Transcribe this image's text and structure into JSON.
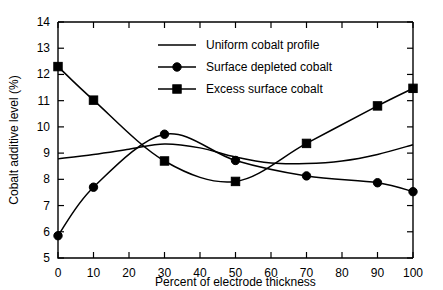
{
  "chart_data": {
    "type": "line",
    "title": "",
    "xlabel": "Percent of electrode thickness",
    "ylabel": "Cobalt additive level (%)",
    "x": [
      0,
      10,
      20,
      30,
      40,
      50,
      60,
      70,
      80,
      90,
      100
    ],
    "xlim": [
      0,
      100
    ],
    "ylim": [
      5,
      14
    ],
    "xticks": [
      "0",
      "10",
      "20",
      "30",
      "40",
      "50",
      "60",
      "70",
      "80",
      "90",
      "100"
    ],
    "yticks": [
      "5",
      "6",
      "7",
      "8",
      "9",
      "10",
      "11",
      "12",
      "13",
      "14"
    ],
    "grid": false,
    "legend_position": "top-center",
    "series": [
      {
        "name": "Uniform cobalt profile",
        "marker": "none",
        "x": [
          0,
          10,
          20,
          30,
          40,
          50,
          60,
          70,
          80,
          90,
          100
        ],
        "values": [
          8.78,
          8.95,
          9.15,
          9.35,
          9.2,
          8.85,
          8.62,
          8.6,
          8.7,
          8.95,
          9.32
        ]
      },
      {
        "name": "Surface depleted cobalt",
        "marker": "circle",
        "x": [
          0,
          10,
          30,
          50,
          70,
          90,
          100
        ],
        "values": [
          5.85,
          7.7,
          9.72,
          8.72,
          8.13,
          7.87,
          7.53
        ]
      },
      {
        "name": "Excess surface cobalt",
        "marker": "square",
        "x": [
          0,
          10,
          30,
          50,
          70,
          90,
          100
        ],
        "values": [
          12.3,
          11.02,
          8.7,
          7.92,
          9.37,
          10.8,
          11.47
        ]
      }
    ]
  },
  "legend": {
    "items": [
      {
        "label": "Uniform cobalt profile",
        "marker": "none"
      },
      {
        "label": "Surface depleted cobalt",
        "marker": "circle"
      },
      {
        "label": "Excess surface cobalt",
        "marker": "square"
      }
    ]
  }
}
